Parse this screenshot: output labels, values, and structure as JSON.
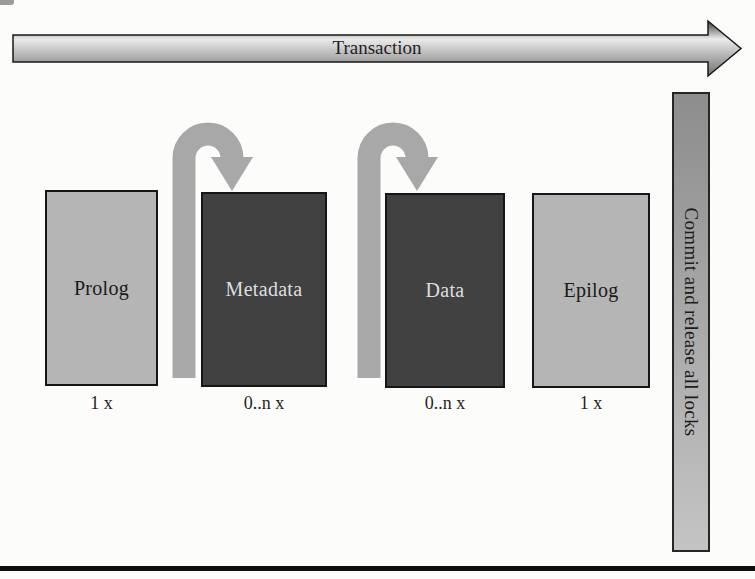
{
  "transaction_arrow": {
    "label": "Transaction"
  },
  "stages": [
    {
      "id": "prolog",
      "label": "Prolog",
      "multiplicity": "1 x",
      "variant": "light",
      "loop": false
    },
    {
      "id": "metadata",
      "label": "Metadata",
      "multiplicity": "0..n x",
      "variant": "dark",
      "loop": true
    },
    {
      "id": "data",
      "label": "Data",
      "multiplicity": "0..n x",
      "variant": "dark",
      "loop": true
    },
    {
      "id": "epilog",
      "label": "Epilog",
      "multiplicity": "1 x",
      "variant": "light",
      "loop": false
    }
  ],
  "commit_bar": {
    "label": "Commit and release all locks"
  },
  "colors": {
    "page-bg": "#fcfcfb",
    "light-box": "#b5b5b5",
    "dark-box": "#414141",
    "light-box-text": "#1a1a1a",
    "dark-box-text": "#dedede",
    "box-border": "#161616",
    "loop-arrow": "#a8a8a8",
    "hgrad-top": "#3f3f3f",
    "hgrad-mid": "#ebebeb",
    "hgrad-bottom": "#707070",
    "arrow-outline": "#181818",
    "bar-top": "#8d8d8d",
    "bar-bottom": "#c4c4c4",
    "bar-border": "#262626",
    "bar-text": "#1c1c1c",
    "rule": "#0e0e0e",
    "diagram-text": "#1f1f1f"
  }
}
